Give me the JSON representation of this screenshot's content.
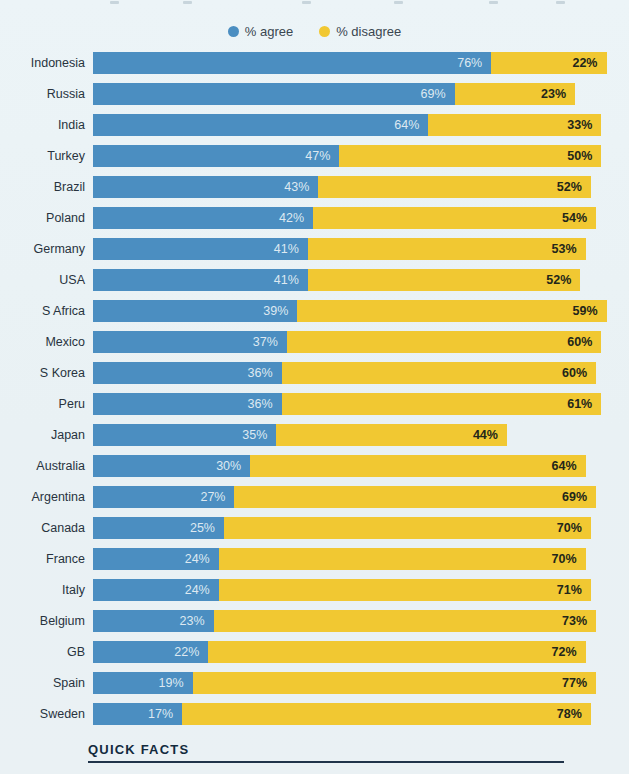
{
  "legend": {
    "items": [
      {
        "label": "% agree",
        "color": "#4b8ec1"
      },
      {
        "label": "% disagree",
        "color": "#f1c832"
      }
    ]
  },
  "chart_data": {
    "type": "bar",
    "orientation": "horizontal",
    "stacked": true,
    "grid": false,
    "legend_position": "top-center",
    "xlim": [
      0,
      100
    ],
    "value_suffix": "%",
    "categories": [
      "Indonesia",
      "Russia",
      "India",
      "Turkey",
      "Brazil",
      "Poland",
      "Germany",
      "USA",
      "S Africa",
      "Mexico",
      "S Korea",
      "Peru",
      "Japan",
      "Australia",
      "Argentina",
      "Canada",
      "France",
      "Italy",
      "Belgium",
      "GB",
      "Spain",
      "Sweden"
    ],
    "series": [
      {
        "name": "% agree",
        "color": "#4b8ec1",
        "values": [
          76,
          69,
          64,
          47,
          43,
          42,
          41,
          41,
          39,
          37,
          36,
          36,
          35,
          30,
          27,
          25,
          24,
          24,
          23,
          22,
          19,
          17
        ]
      },
      {
        "name": "% disagree",
        "color": "#f1c832",
        "values": [
          22,
          23,
          33,
          50,
          52,
          54,
          53,
          52,
          59,
          60,
          60,
          61,
          44,
          64,
          69,
          70,
          70,
          71,
          73,
          72,
          77,
          78
        ]
      }
    ]
  },
  "footer": {
    "title": "QUICK FACTS"
  }
}
